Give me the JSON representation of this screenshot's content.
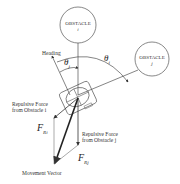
{
  "diagram": {
    "obstacle_i": {
      "name": "OBSTACLE",
      "index": "i"
    },
    "obstacle_j": {
      "name": "OBSTACLE",
      "index": "j"
    },
    "heading_label": "Heading",
    "theta_i": {
      "symbol": "θ",
      "sub": "i"
    },
    "theta_j": {
      "symbol": "θ",
      "sub": "j"
    },
    "force_i_label_line1": "Repulsive Force",
    "force_i_label_line2": "from Obstacle i",
    "force_j_label_line1": "Repulsive Force",
    "force_j_label_line2": "from Obstacle j",
    "F_Ri": {
      "symbol": "F",
      "sub": "R",
      "subsub": "i"
    },
    "F_Rj": {
      "symbol": "F",
      "sub": "R",
      "subsub": "j"
    },
    "movement_vector_label": "Movement Vector",
    "colors": {
      "line": "#333333",
      "background": "#ffffff"
    }
  }
}
